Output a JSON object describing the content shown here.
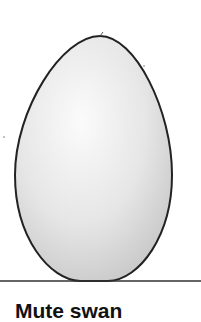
{
  "illustration": {
    "subject": "egg",
    "outline_color": "#222222",
    "fill_light": "#f6f6f6",
    "fill_shadow": "#c8c8c8",
    "ground_line_color": "#333333"
  },
  "caption": {
    "text": "Mute swan"
  }
}
